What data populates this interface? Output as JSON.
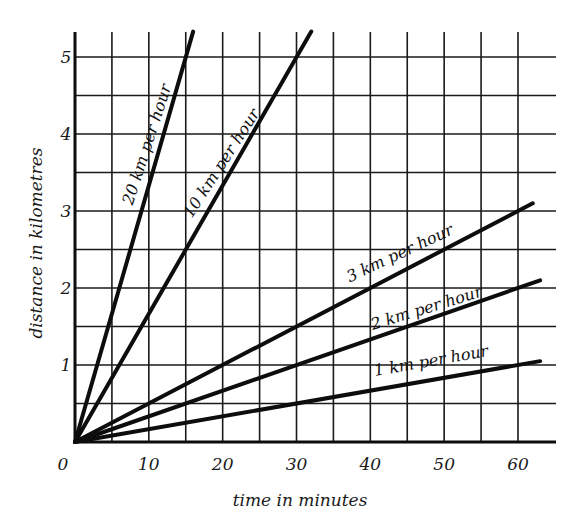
{
  "chart_data": {
    "type": "line",
    "title": "",
    "xlabel": "time in minutes",
    "ylabel": "distance in kilometres",
    "xlim": [
      0,
      65
    ],
    "ylim": [
      0,
      5.3
    ],
    "x_ticks": [
      "0",
      "10",
      "20",
      "30",
      "40",
      "50",
      "60"
    ],
    "y_ticks": [
      "1",
      "2",
      "3",
      "4",
      "5"
    ],
    "grid": true,
    "grid_x_step_minutes": 5,
    "grid_y_step_km": 0.5,
    "legend": "inline labels along lines",
    "series": [
      {
        "name": "20 km per hour",
        "x": [
          0,
          16
        ],
        "y": [
          0,
          5.33
        ]
      },
      {
        "name": "10 km per hour",
        "x": [
          0,
          32
        ],
        "y": [
          0,
          5.33
        ]
      },
      {
        "name": "3 km per hour",
        "x": [
          0,
          62
        ],
        "y": [
          0,
          3.1
        ]
      },
      {
        "name": "2 km per hour",
        "x": [
          0,
          63
        ],
        "y": [
          0,
          2.1
        ]
      },
      {
        "name": "1 km per hour",
        "x": [
          0,
          63
        ],
        "y": [
          0,
          1.05
        ]
      }
    ]
  }
}
